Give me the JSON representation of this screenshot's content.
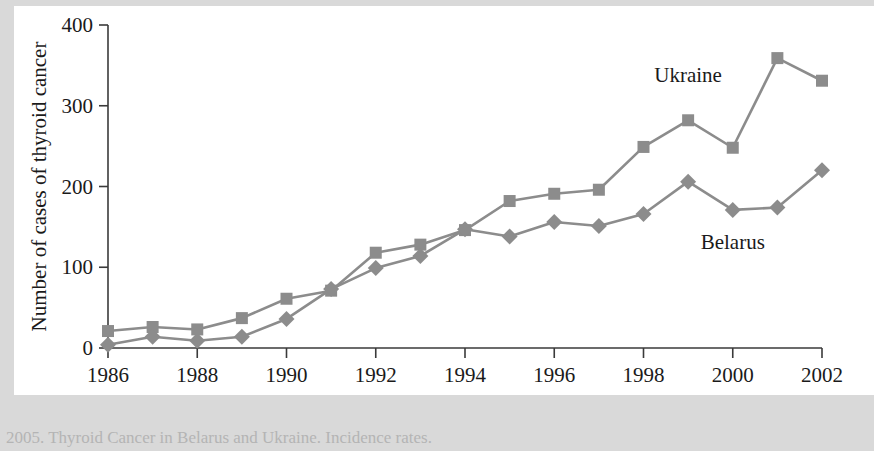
{
  "figure": {
    "background_color": "#d9d9d9",
    "plate_color": "#ffffff",
    "caption_partial": "2005. Thyroid Cancer in Belarus and Ukraine. Incidence rates."
  },
  "chart_data": {
    "type": "line",
    "title": "",
    "xlabel": "Year",
    "ylabel": "Number of cases of thyroid cancer",
    "x": [
      1986,
      1987,
      1988,
      1989,
      1990,
      1991,
      1992,
      1993,
      1994,
      1995,
      1996,
      1997,
      1998,
      1999,
      2000,
      2001,
      2002
    ],
    "xtick_labels": [
      "1986",
      "1988",
      "1990",
      "1992",
      "1994",
      "1996",
      "1998",
      "2000",
      "2002"
    ],
    "xtick_values": [
      1986,
      1988,
      1990,
      1992,
      1994,
      1996,
      1998,
      2000,
      2002
    ],
    "ytick_labels": [
      "0",
      "100",
      "200",
      "300",
      "400"
    ],
    "ytick_values": [
      0,
      100,
      200,
      300,
      400
    ],
    "xlim": [
      1986,
      2002
    ],
    "ylim": [
      0,
      400
    ],
    "grid": false,
    "legend_position": "inline-annotation",
    "series": [
      {
        "name": "Ukraine",
        "marker": "square",
        "color": "#8c8c8c",
        "label_x": 1999,
        "label_y": 330,
        "values": [
          21,
          26,
          23,
          37,
          61,
          71,
          118,
          128,
          146,
          182,
          191,
          196,
          249,
          282,
          248,
          359,
          331
        ]
      },
      {
        "name": "Belarus",
        "marker": "diamond",
        "color": "#8c8c8c",
        "label_x": 2000,
        "label_y": 123,
        "values": [
          4,
          14,
          9,
          14,
          36,
          73,
          99,
          114,
          147,
          138,
          156,
          151,
          166,
          206,
          171,
          174,
          220
        ]
      }
    ]
  }
}
